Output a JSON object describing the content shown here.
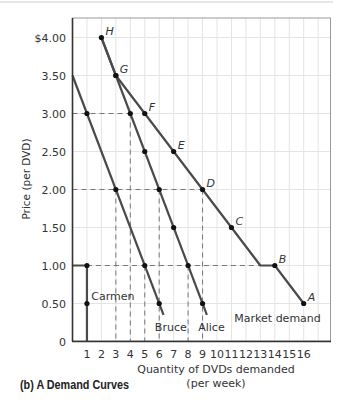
{
  "chart_data": {
    "type": "line",
    "title": "",
    "caption": "(b)  A Demand Curves",
    "xlabel": "Quantity of DVDs demanded",
    "xlabel_sub": "(per week)",
    "ylabel": "Price (per DVD)",
    "xlim": [
      0,
      16.5
    ],
    "ylim": [
      0,
      4.25
    ],
    "grid": true,
    "x_ticks": [
      "1",
      "2",
      "3",
      "4",
      "5",
      "6",
      "7",
      "8",
      "9",
      "10",
      "11",
      "12",
      "13",
      "14",
      "15",
      "16"
    ],
    "y_ticks": [
      {
        "value": 0,
        "label": "0"
      },
      {
        "value": 0.5,
        "label": "0.50"
      },
      {
        "value": 1.0,
        "label": "1.00"
      },
      {
        "value": 1.5,
        "label": "1.50"
      },
      {
        "value": 2.0,
        "label": "2.00"
      },
      {
        "value": 2.5,
        "label": "2.50"
      },
      {
        "value": 3.0,
        "label": "3.00"
      },
      {
        "value": 3.5,
        "label": "3.50"
      },
      {
        "value": 4.0,
        "label": "$4.00"
      }
    ],
    "series": [
      {
        "name": "Carmen",
        "line": [
          [
            0,
            1.0
          ],
          [
            1,
            1.0
          ],
          [
            1,
            0
          ]
        ],
        "dots": [
          [
            1,
            1.0
          ],
          [
            1,
            0.5
          ]
        ],
        "label_pos": [
          1.3,
          0.55
        ]
      },
      {
        "name": "Bruce",
        "line": [
          [
            0,
            3.5
          ],
          [
            6.3,
            0.35
          ]
        ],
        "dots": [
          [
            1,
            3.0
          ],
          [
            3,
            2.0
          ],
          [
            5,
            1.0
          ],
          [
            6,
            0.5
          ]
        ],
        "label_pos": [
          5.7,
          0.14
        ]
      },
      {
        "name": "Alice",
        "line": [
          [
            2,
            4.0
          ],
          [
            9.3,
            0.35
          ]
        ],
        "dots": [
          [
            2,
            4.0
          ],
          [
            3,
            3.5
          ],
          [
            4,
            3.0
          ],
          [
            5,
            2.5
          ],
          [
            6,
            2.0
          ],
          [
            7,
            1.5
          ],
          [
            8,
            1.0
          ],
          [
            9,
            0.5
          ]
        ],
        "label_pos": [
          8.7,
          0.14
        ]
      },
      {
        "name": "Market demand",
        "line": [
          [
            2,
            4.0
          ],
          [
            3,
            3.5
          ],
          [
            13,
            1.0
          ],
          [
            14,
            1.0
          ],
          [
            16,
            0.5
          ]
        ],
        "dots": [
          [
            3,
            3.5
          ],
          [
            5,
            3.0
          ],
          [
            7,
            2.5
          ],
          [
            9,
            2.0
          ],
          [
            11,
            1.5
          ],
          [
            14,
            1.0
          ],
          [
            16,
            0.5
          ]
        ],
        "label_pos": [
          11.2,
          0.26
        ]
      }
    ],
    "point_labels": [
      {
        "label": "H",
        "x": 2,
        "y": 4.0
      },
      {
        "label": "G",
        "x": 3,
        "y": 3.5
      },
      {
        "label": "F",
        "x": 5,
        "y": 3.0
      },
      {
        "label": "E",
        "x": 7,
        "y": 2.5
      },
      {
        "label": "D",
        "x": 9,
        "y": 2.0
      },
      {
        "label": "C",
        "x": 11,
        "y": 1.5
      },
      {
        "label": "B",
        "x": 14,
        "y": 1.0
      },
      {
        "label": "A",
        "x": 16,
        "y": 0.5
      }
    ],
    "guides": [
      {
        "from": [
          0,
          3.0
        ],
        "to": [
          4,
          3.0
        ]
      },
      {
        "from": [
          4,
          3.0
        ],
        "to": [
          4,
          0
        ]
      },
      {
        "from": [
          0,
          2.0
        ],
        "to": [
          9,
          2.0
        ]
      },
      {
        "from": [
          3,
          2.0
        ],
        "to": [
          3,
          0
        ]
      },
      {
        "from": [
          6,
          2.0
        ],
        "to": [
          6,
          0
        ]
      },
      {
        "from": [
          9,
          2.0
        ],
        "to": [
          9,
          0
        ]
      },
      {
        "from": [
          1,
          1.0
        ],
        "to": [
          13,
          1.0
        ]
      },
      {
        "from": [
          5,
          1.0
        ],
        "to": [
          5,
          0
        ]
      },
      {
        "from": [
          8,
          1.0
        ],
        "to": [
          8,
          0
        ]
      }
    ],
    "colors": {
      "curve": "#4a4a4a",
      "dot": "#111111",
      "guide": "#777777",
      "grid": "#e4e4e4",
      "axis": "#333333",
      "frame": "#9a9a9a"
    }
  }
}
